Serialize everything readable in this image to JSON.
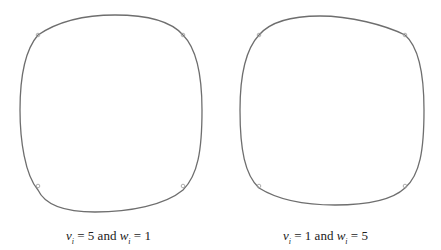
{
  "figure": {
    "panels": [
      {
        "caption": {
          "v_sym": "v",
          "v_sub": "i",
          "v_val": "= 5",
          "and": "and",
          "w_sym": "w",
          "w_sub": "i",
          "w_val": "= 1"
        },
        "curve_color": "#6e6e6e",
        "marker_count": 4
      },
      {
        "caption": {
          "v_sym": "v",
          "v_sub": "i",
          "v_val": "= 1",
          "and": "and",
          "w_sym": "w",
          "w_sub": "i",
          "w_val": "= 5"
        },
        "curve_color": "#6e6e6e",
        "marker_count": 4
      }
    ]
  }
}
